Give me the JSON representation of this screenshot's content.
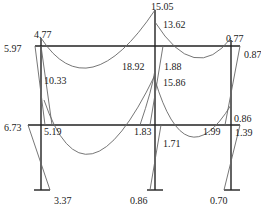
{
  "diagram": {
    "title": "",
    "type": "bending-moment-diagram",
    "frame": {
      "columns": [
        {
          "name": "left-column",
          "x": 41
        },
        {
          "name": "middle-column",
          "x": 155
        },
        {
          "name": "right-column",
          "x": 231
        }
      ],
      "beams": [
        {
          "name": "top-beam",
          "y": 46,
          "x1": 35,
          "x2": 240
        },
        {
          "name": "lower-beam",
          "y": 125,
          "x1": 28,
          "x2": 240
        }
      ],
      "base_y": 190
    },
    "labels": [
      {
        "id": "l1",
        "text": "15.05",
        "x": 151,
        "y": 2
      },
      {
        "id": "l2",
        "text": "4.77",
        "x": 34,
        "y": 30
      },
      {
        "id": "l3",
        "text": "13.62",
        "x": 163,
        "y": 20
      },
      {
        "id": "l4",
        "text": "0.77",
        "x": 226,
        "y": 34
      },
      {
        "id": "l5",
        "text": "5.97",
        "x": 4,
        "y": 44
      },
      {
        "id": "l6",
        "text": "0.87",
        "x": 244,
        "y": 50
      },
      {
        "id": "l7",
        "text": "10.33",
        "x": 44,
        "y": 76
      },
      {
        "id": "l8",
        "text": "18.92",
        "x": 122,
        "y": 62
      },
      {
        "id": "l9",
        "text": "1.88",
        "x": 164,
        "y": 62
      },
      {
        "id": "l10",
        "text": "15.86",
        "x": 163,
        "y": 78
      },
      {
        "id": "l11",
        "text": "6.73",
        "x": 4,
        "y": 123
      },
      {
        "id": "l12",
        "text": "5.19",
        "x": 44,
        "y": 127
      },
      {
        "id": "l13",
        "text": "1.83",
        "x": 134,
        "y": 127
      },
      {
        "id": "l14",
        "text": "1.99",
        "x": 203,
        "y": 127
      },
      {
        "id": "l15",
        "text": "0.86",
        "x": 234,
        "y": 114
      },
      {
        "id": "l16",
        "text": "1.39",
        "x": 235,
        "y": 128
      },
      {
        "id": "l17",
        "text": "1.71",
        "x": 163,
        "y": 139
      },
      {
        "id": "l18",
        "text": "3.37",
        "x": 54,
        "y": 196
      },
      {
        "id": "l19",
        "text": "0.86",
        "x": 130,
        "y": 196
      },
      {
        "id": "l20",
        "text": "0.70",
        "x": 210,
        "y": 196
      }
    ],
    "colors": {
      "frame": "#222222",
      "curve": "#666666"
    }
  }
}
